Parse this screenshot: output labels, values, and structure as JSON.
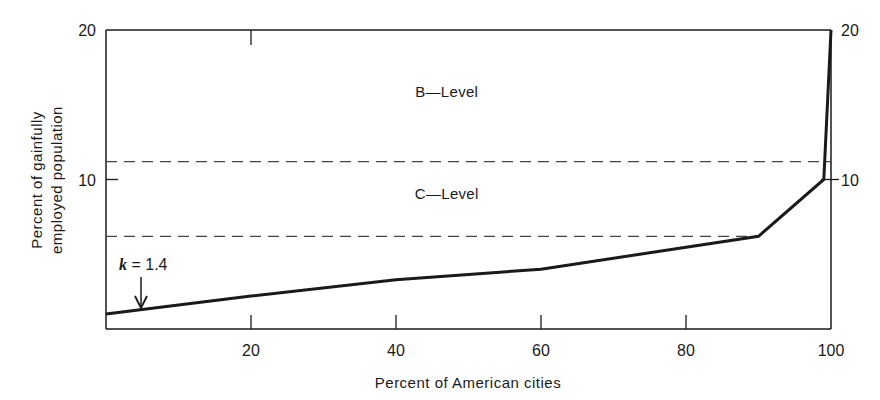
{
  "chart_data": {
    "type": "line",
    "title": "",
    "xlabel": "Percent of American cities",
    "ylabel": "Percent of gainfully employed population",
    "ylabel_lines": [
      "Percent of gainfully",
      "employed population"
    ],
    "xlim": [
      0,
      100
    ],
    "ylim": [
      0,
      20
    ],
    "grid": false,
    "legend": "none",
    "x_ticks": [
      20,
      40,
      60,
      80,
      100
    ],
    "x_tick_labels": [
      "20",
      "40",
      "60",
      "80",
      "100"
    ],
    "y_ticks_left": [
      10,
      20
    ],
    "y_tick_labels_left": [
      "10",
      "20"
    ],
    "y_ticks_right": [
      10,
      20
    ],
    "y_tick_labels_right": [
      "10",
      "20"
    ],
    "series": [
      {
        "name": "Cumulative employment curve",
        "x": [
          0,
          20,
          40,
          60,
          90,
          99,
          100
        ],
        "y": [
          1.0,
          2.2,
          3.3,
          4.0,
          6.2,
          10.0,
          20.0
        ]
      }
    ],
    "reference_lines": [
      {
        "name": "C-level threshold",
        "y": 6.2,
        "style": "dashed"
      },
      {
        "name": "B-level threshold",
        "y": 11.2,
        "style": "dashed"
      }
    ],
    "regions": [
      {
        "label": "B—Level",
        "x": 47,
        "y": 15.5
      },
      {
        "label": "C—Level",
        "x": 47,
        "y": 8.7
      }
    ],
    "annotations": [
      {
        "text_var": "k",
        "text_rest": " = 1.4",
        "arrow_x": 5,
        "arrow_y": 1.4
      }
    ],
    "colors": {
      "line": "#1a1a1a",
      "axes": "#1a1a1a",
      "dashed": "#444444"
    }
  }
}
